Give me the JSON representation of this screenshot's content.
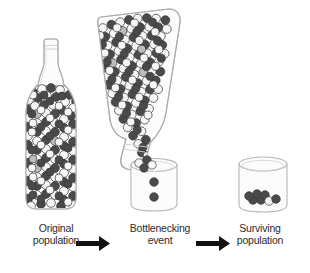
{
  "diagram": {
    "title": "Population bottleneck",
    "background_color": "#ffffff",
    "glass_outline_color": "#b8b8b8",
    "glass_fill_color": "#fcfcfc",
    "arrow_color": "#111111",
    "label_color": "#2b2b2b",
    "bead_colors": {
      "white": "#f7f7f7",
      "dark": "#4a4a4a",
      "light_gray": "#bdbdbd",
      "outline": "#3a3a3a"
    }
  },
  "stages": [
    {
      "id": "original-population",
      "label_line1": "Original",
      "label_line2": "population",
      "vessel": "bottle-upright",
      "bead_count": 168,
      "composition": {
        "white": 78,
        "dark": 82,
        "light_gray": 8
      }
    },
    {
      "id": "bottlenecking-event",
      "label_line1": "Bottlenecking",
      "label_line2": "event",
      "vessel": "bottle-tilted-pouring-into-beaker",
      "bead_count": 150,
      "beaker_bead_count": 2,
      "composition": {
        "white": 66,
        "dark": 78,
        "light_gray": 6
      }
    },
    {
      "id": "surviving-population",
      "label_line1": "Surviving",
      "label_line2": "population",
      "vessel": "beaker",
      "bead_count": 7,
      "composition": {
        "white": 1,
        "dark": 6,
        "light_gray": 0
      }
    }
  ],
  "arrows": [
    {
      "id": "arrow-1",
      "from": "original-population",
      "to": "bottlenecking-event",
      "direction": "right"
    },
    {
      "id": "arrow-2",
      "from": "bottlenecking-event",
      "to": "surviving-population",
      "direction": "right"
    }
  ]
}
